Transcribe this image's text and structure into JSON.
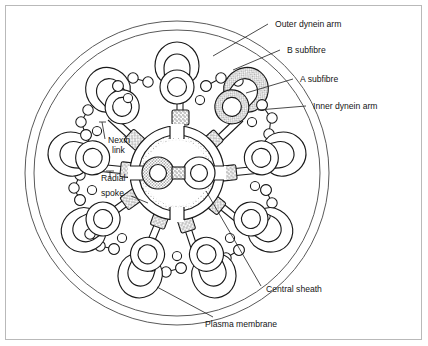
{
  "figure": {
    "background_color": "#ffffff",
    "frame_color": "#b9b9b9",
    "line_color": "#1a1a1a",
    "stipple_color": "#6f6f6f"
  },
  "labels": {
    "outer_dynein_arm": "Outer dynein arm",
    "b_subfibre": "B subfibre",
    "a_subfibre": "A subfibre",
    "inner_dynein_arm": "Inner dynein arm",
    "nexin_link_line1": "Nexin",
    "nexin_link_line2": "link",
    "radial_spoke_line1": "Radial",
    "radial_spoke_line2": "spoke",
    "central_sheath": "Central sheath",
    "plasma_membrane": "Plasma membrane"
  },
  "structure": {
    "doublet_count": 9,
    "central_pair_count": 2,
    "plasma_membrane_rings": 2,
    "radial_spoke_count": 9,
    "highlighted_doublet_index": 1,
    "central_ring_radius": 47,
    "doublet_ring_radius": 108,
    "membrane_outer_radius": 152,
    "membrane_inner_radius": 143,
    "center_x": 177,
    "center_y": 173
  },
  "leader_lines": [
    {
      "name": "outer-dynein-arm-leader",
      "x1": 268,
      "y1": 24,
      "x2": 213,
      "y2": 54
    },
    {
      "name": "b-subfibre-leader",
      "x1": 280,
      "y1": 50,
      "x2": 231,
      "y2": 70
    },
    {
      "name": "a-subfibre-leader",
      "x1": 293,
      "y1": 79,
      "x2": 244,
      "y2": 93
    },
    {
      "name": "inner-dynein-arm-leader",
      "x1": 306,
      "y1": 106,
      "x2": 256,
      "y2": 110
    },
    {
      "name": "central-sheath-leader",
      "x1": 262,
      "y1": 286,
      "x2": 207,
      "y2": 190
    },
    {
      "name": "plasma-membrane-leader",
      "x1": 212,
      "y1": 318,
      "x2": 156,
      "y2": 288
    },
    {
      "name": "nexin-link-leader",
      "x1": 104,
      "y1": 140,
      "x2": 101,
      "y2": 123
    },
    {
      "name": "radial-spoke-leader",
      "x1": 131,
      "y1": 196,
      "x2": 149,
      "y2": 202
    }
  ]
}
